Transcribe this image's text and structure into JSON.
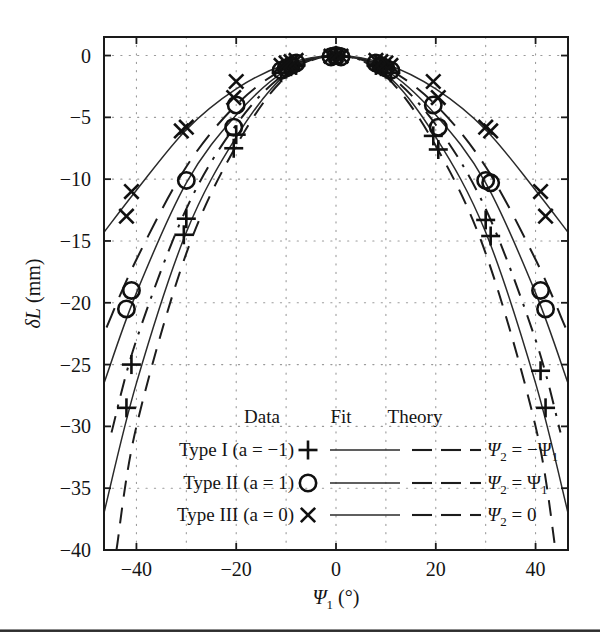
{
  "figure": {
    "name": "delta-L-versus-psi1-plot",
    "background": "#ffffff",
    "ink": "#141414"
  },
  "axes": {
    "xlabel_main": "Ψ",
    "xlabel_sub": "1",
    "xlabel_unit": "(°)",
    "ylabel_main": "δL",
    "ylabel_unit": "(mm)",
    "xticks": [
      "-40",
      "-20",
      "0",
      "20",
      "40"
    ],
    "xtick_values": [
      -40,
      -20,
      0,
      20,
      40
    ],
    "yticks": [
      "0",
      "-5",
      "-10",
      "-15",
      "-20",
      "-25",
      "-30",
      "-35",
      "-40"
    ],
    "ytick_values": [
      0,
      -5,
      -10,
      -15,
      -20,
      -25,
      -30,
      -35,
      -40
    ],
    "xlim": [
      -46.5,
      46.5
    ],
    "ylim": [
      -40,
      1.5
    ],
    "grid": "dotted"
  },
  "legend": {
    "headers": [
      "Data",
      "Fit",
      "Theory"
    ],
    "rows": [
      {
        "label": "Type I (a = −1) ",
        "marker": "plus",
        "theory_main": "Ψ",
        "theory_sub": "2",
        "theory_rhs": "= −Ψ",
        "theory_rhs_sub": "1"
      },
      {
        "label": "Type II (a = 1) ",
        "marker": "circle",
        "theory_main": "Ψ",
        "theory_sub": "2",
        "theory_rhs": "= Ψ",
        "theory_rhs_sub": "1"
      },
      {
        "label": "Type III (a = 0) ",
        "marker": "cross",
        "theory_main": "Ψ",
        "theory_sub": "2",
        "theory_rhs": "= 0",
        "theory_rhs_sub": ""
      }
    ]
  },
  "chart_data": {
    "type": "scatter",
    "title": "",
    "xlabel": "Ψ₁ (°)",
    "ylabel": "δL (mm)",
    "xlim": [
      -46.5,
      46.5
    ],
    "ylim": [
      -40,
      1.5
    ],
    "grid": true,
    "legend_position": "inside-bottom",
    "series": [
      {
        "name": "Type I (a = -1)",
        "marker": "plus",
        "fit_style": "solid",
        "theory_style": "dashed",
        "points_x": [
          -42.0,
          -41.0,
          -30.5,
          -30.0,
          -20.5,
          -20.0,
          -11.0,
          -10.0,
          -9.0,
          -8.0,
          -1.0,
          0.0,
          1.0,
          8.0,
          9.0,
          10.0,
          11.0,
          19.5,
          20.5,
          30.0,
          31.0,
          41.0,
          42.0
        ],
        "points_y": [
          -28.5,
          -25.0,
          -14.5,
          -13.2,
          -7.5,
          -6.4,
          -1.4,
          -1.1,
          -0.9,
          -0.8,
          -0.1,
          0.0,
          -0.1,
          -0.8,
          -0.9,
          -1.1,
          -1.4,
          -6.5,
          -7.6,
          -13.3,
          -14.6,
          -25.5,
          -28.5
        ],
        "fit_x": [
          -46.5,
          -40,
          -30,
          -20,
          -10,
          0,
          10,
          20,
          30,
          40,
          46.5
        ],
        "fit_y": [
          -37.0,
          -26.5,
          -14.3,
          -6.6,
          -1.5,
          0.0,
          -1.5,
          -6.6,
          -14.3,
          -26.5,
          -37.0
        ],
        "theory_x": [
          -44.0,
          -40,
          -30,
          -20,
          -10,
          0,
          10,
          20,
          30,
          40,
          44.0
        ],
        "theory_y": [
          -40.0,
          -30.0,
          -16.0,
          -7.3,
          -1.7,
          0.0,
          -1.7,
          -7.3,
          -16.0,
          -30.0,
          -40.0
        ]
      },
      {
        "name": "Type II (a = 1)",
        "marker": "circle",
        "fit_style": "solid",
        "theory_style": "dash-dot",
        "points_x": [
          -42.0,
          -41.0,
          -30.0,
          -20.5,
          -20.0,
          -11.0,
          -10.0,
          -9.0,
          -8.0,
          -1.0,
          0.0,
          1.0,
          8.0,
          9.0,
          10.0,
          11.0,
          19.5,
          20.5,
          30.0,
          31.0,
          41.0,
          42.0
        ],
        "points_y": [
          -20.5,
          -19.0,
          -10.1,
          -5.8,
          -4.0,
          -1.2,
          -1.0,
          -0.8,
          -0.6,
          -0.1,
          0.0,
          -0.1,
          -0.6,
          -0.8,
          -1.0,
          -1.2,
          -4.0,
          -5.8,
          -10.1,
          -10.3,
          -19.0,
          -20.5
        ],
        "fit_x": [
          -46.5,
          -40,
          -30,
          -20,
          -10,
          0,
          10,
          20,
          30,
          40,
          46.5
        ],
        "fit_y": [
          -26.5,
          -19.2,
          -10.3,
          -4.8,
          -1.2,
          0.0,
          -1.2,
          -4.8,
          -10.3,
          -19.2,
          -26.5
        ],
        "theory_x": [
          -45.0,
          -40,
          -30,
          -20,
          -10,
          0,
          10,
          20,
          30,
          40,
          45.0
        ],
        "theory_y": [
          -30.5,
          -23.0,
          -12.4,
          -5.6,
          -1.4,
          0.0,
          -1.4,
          -5.6,
          -12.4,
          -23.0,
          -30.5
        ]
      },
      {
        "name": "Type III (a = 0)",
        "marker": "cross",
        "fit_style": "solid",
        "theory_style": "long-dash",
        "points_x": [
          -42.0,
          -41.0,
          -31.0,
          -30.0,
          -20.5,
          -20.0,
          -11.0,
          -10.0,
          -9.0,
          -8.0,
          -1.0,
          0.0,
          1.0,
          8.0,
          9.0,
          10.0,
          11.0,
          19.5,
          20.5,
          30.0,
          31.0,
          41.0,
          42.0
        ],
        "points_y": [
          -13.0,
          -11.0,
          -6.1,
          -5.8,
          -3.4,
          -2.1,
          -0.8,
          -0.6,
          -0.5,
          -0.4,
          -0.05,
          0.0,
          -0.05,
          -0.4,
          -0.5,
          -0.6,
          -0.8,
          -2.1,
          -3.4,
          -5.8,
          -6.1,
          -11.0,
          -13.0
        ],
        "fit_x": [
          -46.5,
          -40,
          -30,
          -20,
          -10,
          0,
          10,
          20,
          30,
          40,
          46.5
        ],
        "fit_y": [
          -14.3,
          -10.9,
          -6.0,
          -2.7,
          -0.7,
          0.0,
          -0.7,
          -2.7,
          -6.0,
          -10.9,
          -14.3
        ],
        "theory_x": [
          -46.0,
          -40,
          -30,
          -20,
          -10,
          0,
          10,
          20,
          30,
          40,
          46.0
        ],
        "theory_y": [
          -22.0,
          -16.5,
          -9.0,
          -4.0,
          -1.0,
          0.0,
          -1.0,
          -4.0,
          -9.0,
          -16.5,
          -22.0
        ]
      }
    ]
  }
}
